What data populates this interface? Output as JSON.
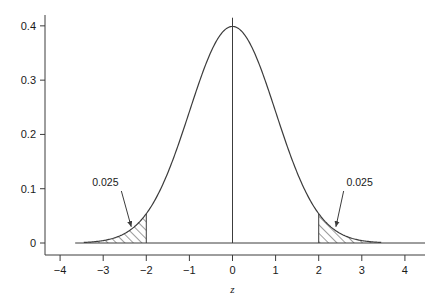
{
  "chart_data": {
    "type": "area",
    "title": "",
    "subtitle": "",
    "xlabel": "z",
    "ylabel": "",
    "xlim": [
      -4.35,
      4.35
    ],
    "ylim": [
      0,
      0.42
    ],
    "grid": false,
    "legend": null,
    "distribution": "standard normal density",
    "peak_value": 0.3989,
    "x_ticks": [
      -4,
      -3,
      -2,
      -1,
      0,
      1,
      2,
      3,
      4
    ],
    "x_tick_labels": [
      "−4",
      "−3",
      "−2",
      "−1",
      "0",
      "1",
      "2",
      "3",
      "4"
    ],
    "y_ticks": [
      0,
      0.1,
      0.2,
      0.3,
      0.4
    ],
    "y_tick_labels": [
      "0",
      "0.1",
      "0.2",
      "0.3",
      "0.4"
    ],
    "series": [
      {
        "name": "standard normal pdf",
        "x": [
          -3.4,
          -3.2,
          -3.0,
          -2.8,
          -2.6,
          -2.4,
          -2.2,
          -2.0,
          -1.8,
          -1.6,
          -1.4,
          -1.2,
          -1.0,
          -0.8,
          -0.6,
          -0.4,
          -0.2,
          0.0,
          0.2,
          0.4,
          0.6,
          0.8,
          1.0,
          1.2,
          1.4,
          1.6,
          1.8,
          2.0,
          2.2,
          2.4,
          2.6,
          2.8,
          3.0,
          3.2,
          3.4
        ],
        "values": [
          0.0012,
          0.0024,
          0.0044,
          0.0079,
          0.0136,
          0.0224,
          0.0355,
          0.054,
          0.079,
          0.1109,
          0.1497,
          0.1942,
          0.242,
          0.2897,
          0.3332,
          0.3683,
          0.391,
          0.3989,
          0.391,
          0.3683,
          0.3332,
          0.2897,
          0.242,
          0.1942,
          0.1497,
          0.1109,
          0.079,
          0.054,
          0.0355,
          0.0224,
          0.0136,
          0.0079,
          0.0044,
          0.0024,
          0.0012
        ]
      }
    ],
    "shaded_regions": [
      {
        "name": "left-tail",
        "from": -3.4,
        "to": -2.0,
        "area": 0.025,
        "label": "0.025",
        "hatch": "forward-slash"
      },
      {
        "name": "right-tail",
        "from": 2.0,
        "to": 3.4,
        "area": 0.025,
        "label": "0.025",
        "hatch": "forward-slash"
      }
    ],
    "annotations": [
      {
        "name": "left-area-label",
        "text": "0.025",
        "x": -2.95,
        "y": 0.105,
        "arrow_to_x": -2.35,
        "arrow_to_y": 0.03
      },
      {
        "name": "right-area-label",
        "text": "0.025",
        "x": 2.95,
        "y": 0.105,
        "arrow_to_x": 2.4,
        "arrow_to_y": 0.03
      }
    ],
    "reference_lines": [
      {
        "name": "center-line",
        "orientation": "vertical",
        "x": 0,
        "from_y": 0,
        "to_y": 0.415
      }
    ],
    "colors": {
      "curve": "#3c3c3c",
      "axis": "#3c3c3c",
      "hatch": "#3c3c3c",
      "text": "#1a1a1a",
      "background": "#ffffff"
    }
  }
}
